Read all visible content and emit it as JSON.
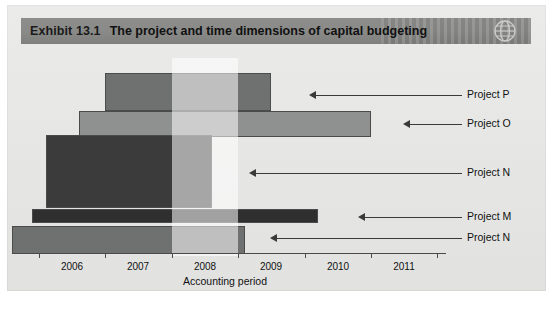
{
  "page": {
    "background": "#e6e7e5"
  },
  "header": {
    "exhibit_number": "Exhibit 13.1",
    "title": "The project and time dimensions of capital budgeting",
    "icon": "globe-icon",
    "bar_color": "#8a8b89"
  },
  "chart_data": {
    "type": "bar",
    "orientation": "horizontal",
    "title": "The project and time dimensions of capital budgeting",
    "xlabel": "Accounting period",
    "ylabel": "",
    "x_tick_labels": [
      "2006",
      "2007",
      "2008",
      "2009",
      "2010",
      "2011"
    ],
    "xlim": [
      2006,
      2012
    ],
    "grid": false,
    "legend": false,
    "categories": [
      "Project P",
      "Project O",
      "Project N",
      "Project M",
      "Project N"
    ],
    "bars": [
      {
        "label": "Project P",
        "start": 2007.0,
        "end": 2009.5,
        "color": "#6f7170",
        "row": 0
      },
      {
        "label": "Project O",
        "start": 2006.6,
        "end": 2011.0,
        "color": "#8e918f",
        "row": 1
      },
      {
        "label": "Project N",
        "start": 2006.1,
        "end": 2008.6,
        "color": "#3a3b3a",
        "row": 2
      },
      {
        "label": "Project M",
        "start": 2005.9,
        "end": 2010.2,
        "color": "#2e2f2e",
        "row": 3
      },
      {
        "label": "Project N",
        "start": 2005.6,
        "end": 2009.1,
        "color": "#6f7170",
        "row": 4
      }
    ],
    "highlight_band": {
      "start": 2008.0,
      "end": 2009.0,
      "color": "rgba(255,255,255,0.55)"
    },
    "annotations": [
      {
        "text": "Project P",
        "points_to": "Project P bar right edge"
      },
      {
        "text": "Project O",
        "points_to": "Project O bar right edge"
      },
      {
        "text": "Project N",
        "points_to": "Project N dark bar right edge"
      },
      {
        "text": "Project M",
        "points_to": "Project M bar right edge"
      },
      {
        "text": "Project N",
        "points_to": "Project N bottom bar right edge"
      }
    ]
  },
  "axis": {
    "title": "Accounting period",
    "ticks": [
      "2006",
      "2007",
      "2008",
      "2009",
      "2010",
      "2011"
    ]
  },
  "labels": {
    "project_p": "Project P",
    "project_o": "Project O",
    "project_n_big": "Project N",
    "project_m": "Project M",
    "project_n_small": "Project N"
  }
}
